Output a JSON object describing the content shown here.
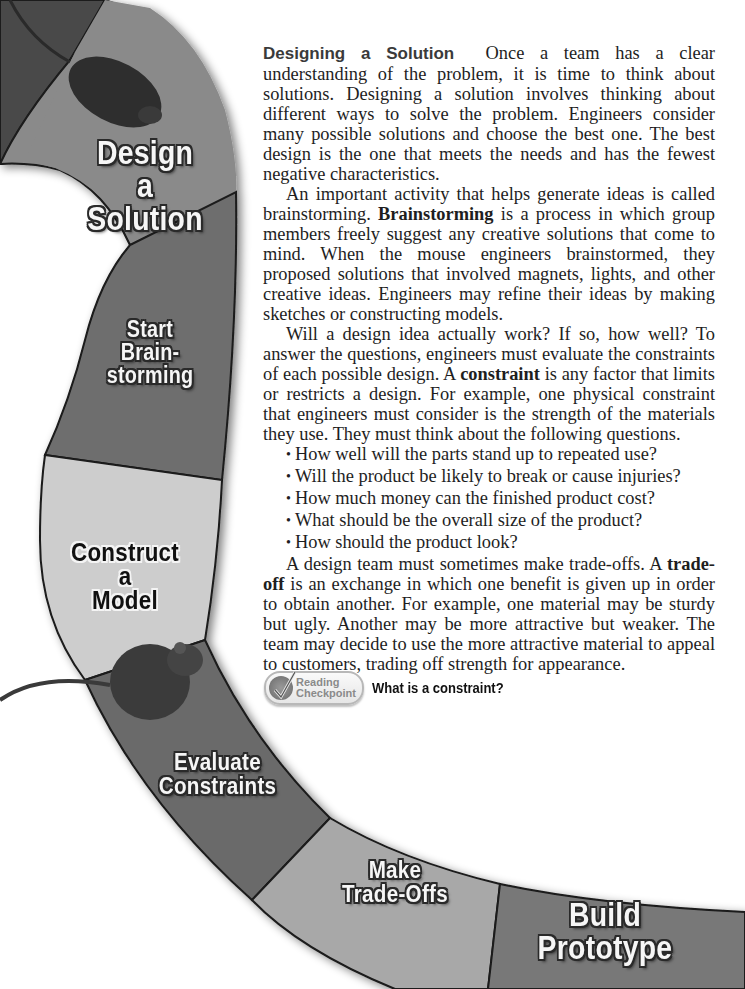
{
  "road": {
    "segments": [
      {
        "id": "design-solution",
        "lines": [
          "Design",
          "a",
          "Solution"
        ],
        "style": "light",
        "fill": "#8a8a8a"
      },
      {
        "id": "start-brainstorming",
        "lines": [
          "Start",
          "Brain-",
          "storming"
        ],
        "style": "light",
        "fill": "#6e6e6e"
      },
      {
        "id": "construct-model",
        "lines": [
          "Construct",
          "a",
          "Model"
        ],
        "style": "dark",
        "fill": "#cdcdcd"
      },
      {
        "id": "evaluate-constraints",
        "lines": [
          "Evaluate",
          "Constraints"
        ],
        "style": "dark",
        "fill": "#6a6a6a"
      },
      {
        "id": "make-trade-offs",
        "lines": [
          "Make",
          "Trade-Offs"
        ],
        "style": "dark",
        "fill": "#a8a8a8"
      },
      {
        "id": "build-prototype",
        "lines": [
          "Build",
          "Prototype"
        ],
        "style": "light",
        "fill": "#787878"
      }
    ]
  },
  "article": {
    "p1": {
      "heading": "Designing a Solution",
      "text": "Once a team has a clear understanding of the problem, it is time to think about solutions. Designing a solution involves thinking about different ways to solve the problem. Engineers consider many possible solutions and choose the best one. The best design is the one that meets the needs and has the fewest negative characteristics."
    },
    "p2": {
      "before": "An important activity that helps generate ideas is called brainstorming. ",
      "term": "Brainstorming",
      "after": " is a process in which group members freely suggest any creative solutions that come to mind. When the mouse engineers brainstormed, they proposed solutions that involved magnets, lights, and other creative ideas. Engineers may refine their ideas by making sketches or constructing models."
    },
    "p3": {
      "before": "Will a design idea actually work? If so, how well? To answer the questions, engineers must evaluate the constraints of each possible design. A ",
      "term": "constraint",
      "after": " is any factor that limits or restricts a design. For example, one physical constraint that engineers must consider is the strength of the materials they use. They must think about the following questions."
    },
    "questions": [
      "How well will the parts stand up to repeated use?",
      "Will the product be likely to break or cause injuries?",
      "How much money can the finished product cost?",
      "What should be the overall size of the product?",
      "How should the product look?"
    ],
    "p4": {
      "before": "A design team must sometimes make trade-offs. A ",
      "term": "trade-off",
      "after": " is an exchange in which one benefit is given up in order to obtain another. For example, one material may be sturdy but ugly. Another may be more attractive but weaker. The team may decide to use the more attractive material to appeal to customers, trading off strength for appearance."
    }
  },
  "checkpoint": {
    "badge_line1": "Reading",
    "badge_line2": "Checkpoint",
    "question": "What is a constraint?"
  }
}
